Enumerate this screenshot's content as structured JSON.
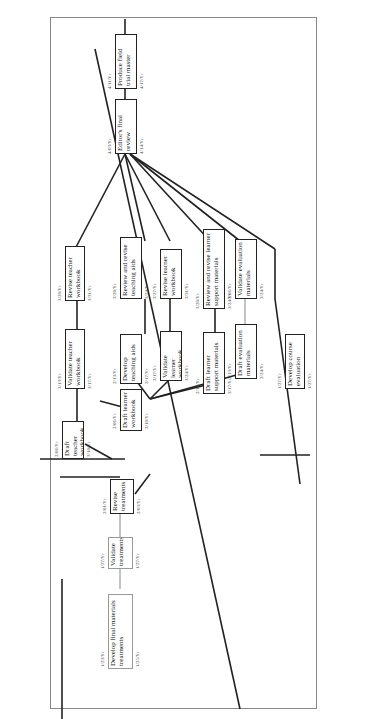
{
  "diagram": {
    "type": "pert-network",
    "nodes": [
      {
        "id": "develop-final",
        "label": "Develop final materials treatments",
        "start": "1/23/Yr",
        "end": "1/25/Yr"
      },
      {
        "id": "validate-treatments",
        "label": "Validate treatments",
        "start": "1/27/Yr",
        "end": "1/27/Yr"
      },
      {
        "id": "revise-treatments",
        "label": "Revise treatments",
        "start": "2/01/Yr",
        "end": "2/03/Yr"
      },
      {
        "id": "draft-teacher-workbook",
        "label": "Draft teacher workbook",
        "start": "2/06/Yr",
        "end": "3/10/Yr"
      },
      {
        "id": "validate-teacher-workbook",
        "label": "Validate teacher workbook",
        "start": "3/13/Yr",
        "end": "3/17/Yr"
      },
      {
        "id": "revise-teacher-workbook",
        "label": "Revise teacher workbook",
        "start": "3/20/Yr",
        "end": "3/31/Yr"
      },
      {
        "id": "draft-learner-workbook",
        "label": "Draft learner workbook",
        "start": "2/06/Yr",
        "end": "3/10/Yr"
      },
      {
        "id": "develop-teaching-aids",
        "label": "Develop teaching aids",
        "start": "2/13/Yr",
        "end": "3/17/Yr"
      },
      {
        "id": "review-teaching-aids",
        "label": "Review and revise teaching aids",
        "start": "3/20/Yr",
        "end": "3/24/Yr"
      },
      {
        "id": "validate-learner-workbook",
        "label": "Validate learner workbook",
        "start": "3/17/Yr",
        "end": "3/24/Yr"
      },
      {
        "id": "revise-learner-workbook",
        "label": "Revise learner workbook",
        "start": "3/27/Yr",
        "end": "3/31/Yr"
      },
      {
        "id": "draft-learner-support",
        "label": "Draft learner support materials",
        "start": "2/13/Yr",
        "end": "3/17/Yr"
      },
      {
        "id": "review-learner-support",
        "label": "Review and revise learner support materials",
        "start": "3/20/Yr",
        "end": "3/24/Yr"
      },
      {
        "id": "draft-evaluation",
        "label": "Draft evaluation materials",
        "start": "2/13/Yr",
        "end": "2/24/Yr"
      },
      {
        "id": "validate-evaluation",
        "label": "Validate evaluation materials",
        "start": "3/06/Yr",
        "end": "3/24/Yr"
      },
      {
        "id": "develop-course-evaluation",
        "label": "Develop course evaluation",
        "start": "1/27/Yr",
        "end": "1/27/Yr"
      },
      {
        "id": "editors-final-review",
        "label": "Editor's final review",
        "start": "4/03/Yr",
        "end": "4/14/Yr"
      },
      {
        "id": "produce-field-trial",
        "label": "Produce field trial master",
        "start": "4/11/Yr",
        "end": "4/17/Yr"
      }
    ]
  }
}
